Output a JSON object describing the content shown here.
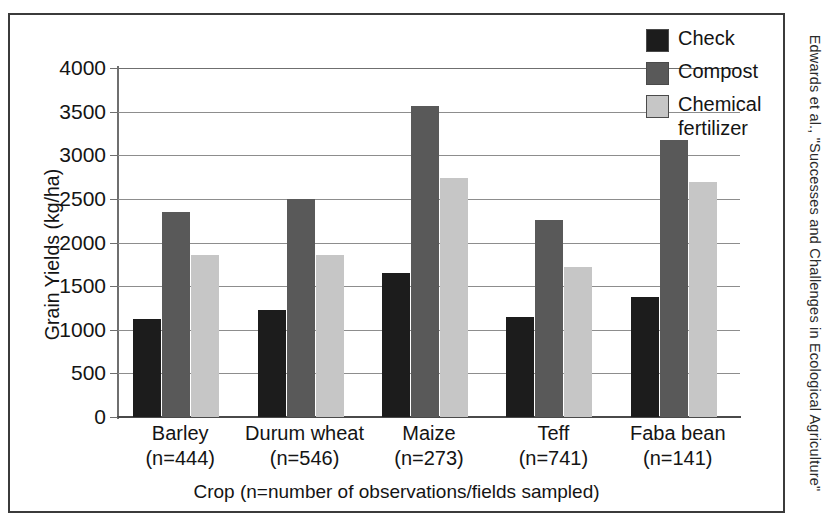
{
  "credit": {
    "text": "Edwards et al., \"Successes and Challenges in Ecological Agriculture\""
  },
  "chart_data": {
    "type": "bar",
    "title": "",
    "xlabel": "Crop (n=number of observations/fields sampled)",
    "ylabel": "Grain Yields (kg/ha)",
    "ylim": [
      0,
      4000
    ],
    "yticks": [
      0,
      500,
      1000,
      1500,
      2000,
      2500,
      3000,
      3500,
      4000
    ],
    "ytick_labels": [
      "0",
      "500",
      "1000",
      "1500",
      "2000",
      "2500",
      "3000",
      "3500",
      "4000"
    ],
    "grid": true,
    "legend_position": "top-right",
    "categories": [
      "Barley",
      "Durum wheat",
      "Maize",
      "Teff",
      "Faba bean"
    ],
    "category_counts": [
      "(n=444)",
      "(n=546)",
      "(n=273)",
      "(n=741)",
      "(n=141)"
    ],
    "series": [
      {
        "name": "Check",
        "color": "#1c1c1c",
        "values": [
          1120,
          1230,
          1650,
          1150,
          1370
        ]
      },
      {
        "name": "Compost",
        "color": "#595959",
        "values": [
          2350,
          2500,
          3560,
          2260,
          3180
        ]
      },
      {
        "name": "Chemical fertilizer",
        "color": "#c6c6c6",
        "values": [
          1860,
          1860,
          2740,
          1715,
          2690
        ]
      }
    ],
    "legend": [
      {
        "label": "Check",
        "label_line2": ""
      },
      {
        "label": "Compost",
        "label_line2": ""
      },
      {
        "label": "Chemical",
        "label_line2": "fertilizer"
      }
    ]
  }
}
